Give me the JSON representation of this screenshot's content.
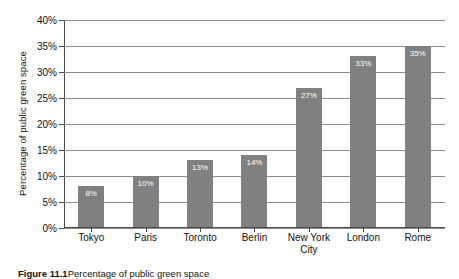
{
  "chart_data": {
    "type": "bar",
    "title": "",
    "subtitle": "",
    "xlabel": "",
    "ylabel": "Percentage of public green space",
    "categories": [
      "Tokyo",
      "Paris",
      "Toronto",
      "Berlin",
      "New York City",
      "London",
      "Rome"
    ],
    "values": [
      8,
      10,
      13,
      14,
      27,
      33,
      35
    ],
    "data_labels": [
      "8%",
      "10%",
      "13%",
      "14%",
      "27%",
      "33%",
      "35%"
    ],
    "ylim": [
      0,
      40
    ],
    "ytick_labels": [
      "0%",
      "5%",
      "10%",
      "15%",
      "20%",
      "25%",
      "30%",
      "35%",
      "40%"
    ],
    "ytick_values": [
      0,
      5,
      10,
      15,
      20,
      25,
      30,
      35,
      40
    ],
    "grid": "horizontal",
    "legend": "none",
    "bar_color": "#808080",
    "gridline_color": "#8c8c8c",
    "axis_color": "#4a4a4a",
    "data_label_color": "#ffffff"
  },
  "caption": {
    "label": "Figure 11.1",
    "text": "Percentage of public green space"
  }
}
